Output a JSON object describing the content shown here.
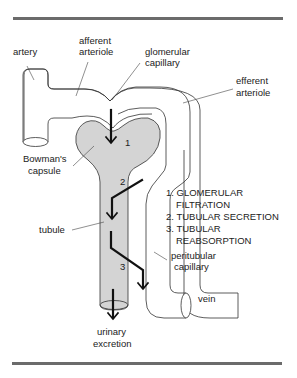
{
  "diagram": {
    "labels": {
      "artery": "artery",
      "afferent_1": "afferent",
      "afferent_2": "arteriole",
      "glomerular_1": "glomerular",
      "glomerular_2": "capillary",
      "efferent_1": "efferent",
      "efferent_2": "arteriole",
      "bowman_1": "Bowman's",
      "bowman_2": "capsule",
      "tubule": "tubule",
      "peritubular_1": "peritubular",
      "peritubular_2": "capillary",
      "vein": "vein",
      "urinary_1": "urinary",
      "urinary_2": "excretion"
    },
    "step_numbers": [
      "1",
      "2",
      "3"
    ],
    "legend": [
      "1. GLOMERULAR",
      "FILTRATION",
      "2. TUBULAR SECRETION",
      "3. TUBULAR",
      "REABSORPTION"
    ],
    "colors": {
      "rule": "#6b6b6b",
      "tubule_fill": "#d4d4d4",
      "line": "#333333",
      "arrow": "#111111"
    }
  }
}
